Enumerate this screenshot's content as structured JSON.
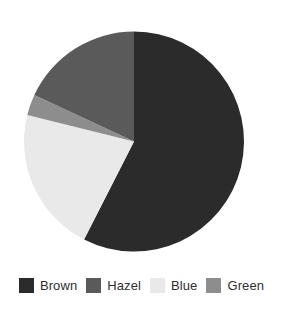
{
  "chart_data": {
    "type": "pie",
    "title": "",
    "subtitle": "",
    "xlabel": "",
    "ylabel": "",
    "grid": false,
    "legend_position": "bottom",
    "categories": [
      "Brown",
      "Hazel",
      "Blue",
      "Green"
    ],
    "values": [
      57.5,
      18.0,
      21.5,
      3.0
    ],
    "units": "percent",
    "start_angle_deg": 0,
    "direction": "clockwise",
    "slices": [
      {
        "label": "Brown",
        "value": 57.5,
        "color": "#2b2b2b",
        "start_angle_deg": 0,
        "end_angle_deg": 207
      },
      {
        "label": "Blue",
        "value": 21.5,
        "color": "#e9e9e9",
        "start_angle_deg": 207,
        "end_angle_deg": 284
      },
      {
        "label": "Green",
        "value": 3.0,
        "color": "#8d8d8d",
        "start_angle_deg": 284,
        "end_angle_deg": 295
      },
      {
        "label": "Hazel",
        "value": 18.0,
        "color": "#5a5a5a",
        "start_angle_deg": 295,
        "end_angle_deg": 360
      }
    ],
    "geometry": {
      "center_x": 134,
      "center_y": 141.5,
      "radius": 110
    }
  },
  "legend": {
    "items": [
      {
        "label": "Brown",
        "color": "#2b2b2b"
      },
      {
        "label": "Hazel",
        "color": "#5a5a5a"
      },
      {
        "label": "Blue",
        "color": "#e9e9e9"
      },
      {
        "label": "Green",
        "color": "#8d8d8d"
      }
    ]
  }
}
